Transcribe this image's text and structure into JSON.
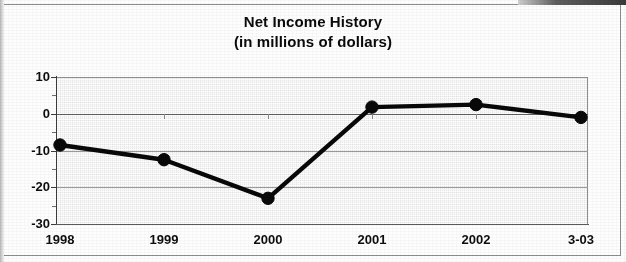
{
  "chart_data": {
    "type": "line",
    "title": "Net Income History",
    "subtitle": "(in millions of dollars)",
    "xlabel": "",
    "ylabel": "",
    "categories": [
      "1998",
      "1999",
      "2000",
      "2001",
      "2002",
      "3-03"
    ],
    "values": [
      -8.5,
      -12.5,
      -23,
      1.8,
      2.5,
      -1
    ],
    "series": [
      {
        "name": "Net Income",
        "values": [
          -8.5,
          -12.5,
          -23,
          1.8,
          2.5,
          -1
        ]
      }
    ],
    "ylim": [
      -30,
      10
    ],
    "ytick_labels": [
      "10",
      "0",
      "-10",
      "-20",
      "-30"
    ],
    "ytick_values": [
      10,
      0,
      -10,
      -20,
      -30
    ],
    "yminor_tick_values": [
      5,
      -5,
      -15,
      -25
    ],
    "grid": true,
    "legend": false,
    "legend_position": "none",
    "line_color": "#080808",
    "marker": "circle",
    "marker_color": "#080808",
    "plot_background": "#ebebeb",
    "gridline_color": "#9a9a9a"
  },
  "figure": {
    "title_line_1": "Net Income History",
    "title_line_2": "(in millions of dollars)"
  }
}
